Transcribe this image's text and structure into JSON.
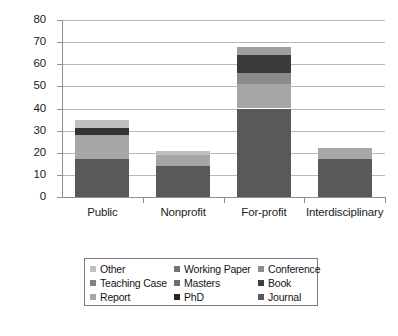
{
  "chart_data": {
    "type": "bar",
    "subtype": "stacked-vertical",
    "title": "",
    "xlabel": "",
    "ylabel": "",
    "ylim": [
      0,
      80
    ],
    "yticks": [
      0,
      10,
      20,
      30,
      40,
      50,
      60,
      70,
      80
    ],
    "grid": "horizontal",
    "legend_position": "bottom",
    "categories": [
      "Public",
      "Nonprofit",
      "For-profit",
      "Interdisciplinary"
    ],
    "series": [
      {
        "name": "Journal",
        "color": "#595959",
        "values": [
          17,
          14,
          40,
          17
        ]
      },
      {
        "name": "PhD",
        "color": "#262626",
        "values": [
          0,
          0,
          0,
          0
        ]
      },
      {
        "name": "Report",
        "color": "#a6a6a6",
        "values": [
          11,
          5,
          11,
          5
        ]
      },
      {
        "name": "Book",
        "color": "#404040",
        "values": [
          0,
          0,
          8,
          0
        ]
      },
      {
        "name": "Masters",
        "color": "#333333",
        "values": [
          3,
          0,
          5,
          0
        ]
      },
      {
        "name": "Teaching Case",
        "color": "#808080",
        "values": [
          0,
          0,
          0,
          0
        ]
      },
      {
        "name": "Conference",
        "color": "#8c8c8c",
        "values": [
          0,
          0,
          0,
          0
        ]
      },
      {
        "name": "Working Paper",
        "color": "#737373",
        "values": [
          0,
          0,
          0,
          0
        ]
      },
      {
        "name": "Other",
        "color": "#bfbfbf",
        "values": [
          4,
          2,
          4,
          0
        ]
      }
    ],
    "totals": [
      35,
      21,
      68,
      22
    ],
    "stack_order_bottom_up": [
      "Journal",
      "Report",
      "Masters",
      "Book",
      "Other"
    ],
    "bars": [
      {
        "category": "Public",
        "total": 35,
        "segments": [
          {
            "name": "Journal",
            "from": 0,
            "to": 17,
            "value": 17,
            "color": "#595959"
          },
          {
            "name": "Report",
            "from": 17,
            "to": 28,
            "value": 11,
            "color": "#a6a6a6"
          },
          {
            "name": "Masters",
            "from": 28,
            "to": 31,
            "value": 3,
            "color": "#333333"
          },
          {
            "name": "Other",
            "from": 31,
            "to": 35,
            "value": 4,
            "color": "#bfbfbf"
          }
        ]
      },
      {
        "category": "Nonprofit",
        "total": 21,
        "segments": [
          {
            "name": "Journal",
            "from": 0,
            "to": 14,
            "value": 14,
            "color": "#595959"
          },
          {
            "name": "Report",
            "from": 14,
            "to": 19,
            "value": 5,
            "color": "#a6a6a6"
          },
          {
            "name": "Other",
            "from": 19,
            "to": 21,
            "value": 2,
            "color": "#bfbfbf"
          }
        ]
      },
      {
        "category": "For-profit",
        "total": 68,
        "segments": [
          {
            "name": "Journal",
            "from": 0,
            "to": 40,
            "value": 40,
            "color": "#595959"
          },
          {
            "name": "Report",
            "from": 40,
            "to": 51,
            "value": 11,
            "color": "#a6a6a6"
          },
          {
            "name": "Masters",
            "from": 51,
            "to": 56,
            "value": 5,
            "color": "#8a8a8a"
          },
          {
            "name": "Book",
            "from": 56,
            "to": 64,
            "value": 8,
            "color": "#3a3a3a"
          },
          {
            "name": "Other",
            "from": 64,
            "to": 68,
            "value": 4,
            "color": "#9f9f9f"
          }
        ]
      },
      {
        "category": "Interdisciplinary",
        "total": 22,
        "segments": [
          {
            "name": "Journal",
            "from": 0,
            "to": 17,
            "value": 17,
            "color": "#595959"
          },
          {
            "name": "Report",
            "from": 17,
            "to": 22,
            "value": 5,
            "color": "#a6a6a6"
          }
        ]
      }
    ]
  },
  "yaxis": {
    "labels": [
      "80",
      "70",
      "60",
      "50",
      "40",
      "30",
      "20",
      "10",
      "0"
    ],
    "values": [
      80,
      70,
      60,
      50,
      40,
      30,
      20,
      10,
      0
    ]
  },
  "xaxis": {
    "labels": [
      "Public",
      "Nonprofit",
      "For-profit",
      "Interdisciplinary"
    ]
  },
  "legend": {
    "items": [
      {
        "label": "Other",
        "color": "#bfbfbf"
      },
      {
        "label": "Working Paper",
        "color": "#737373"
      },
      {
        "label": "Conference",
        "color": "#8c8c8c"
      },
      {
        "label": "Teaching Case",
        "color": "#808080"
      },
      {
        "label": "Masters",
        "color": "#6e6e6e"
      },
      {
        "label": "Book",
        "color": "#3f3f3f"
      },
      {
        "label": "Report",
        "color": "#a6a6a6"
      },
      {
        "label": "PhD",
        "color": "#262626"
      },
      {
        "label": "Journal",
        "color": "#595959"
      }
    ]
  },
  "colors": {
    "grid": "#b9b9b9",
    "axis": "#8f8f8f",
    "text": "#1c1c1c",
    "background": "#ffffff",
    "legend_border": "#7d7d7d"
  }
}
